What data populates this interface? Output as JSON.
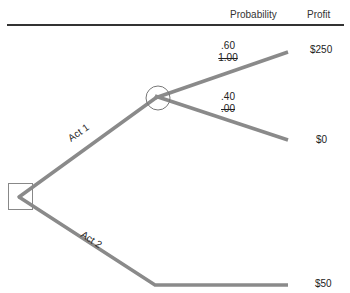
{
  "header": {
    "probability_label": "Probability",
    "profit_label": "Profit"
  },
  "tree": {
    "acts": [
      {
        "label": "Act 1"
      },
      {
        "label": "Act 2"
      }
    ],
    "branches": [
      {
        "probability": ".60",
        "prior_probability": "1.00",
        "profit": "$250"
      },
      {
        "probability": ".40",
        "prior_probability": ".00",
        "profit": "$0"
      },
      {
        "profit": "$50"
      }
    ]
  },
  "colors": {
    "branch_line": "#8a8a8a",
    "node_outline": "#777777",
    "text": "#222222"
  }
}
